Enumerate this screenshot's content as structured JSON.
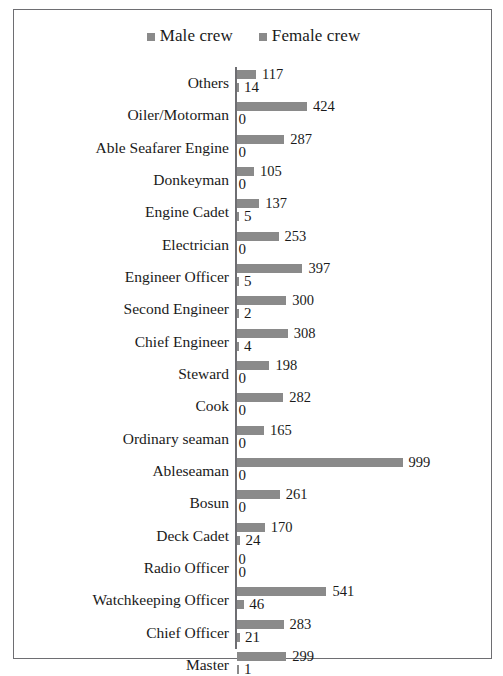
{
  "chart_data": {
    "type": "bar",
    "orientation": "horizontal",
    "grouped": true,
    "title": "",
    "subtitle": "",
    "xlabel": "",
    "ylabel": "",
    "grid": false,
    "legend_position": "top-center",
    "xlim": [
      0,
      999
    ],
    "axis_origin_value": 0,
    "categories": [
      "Others",
      "Oiler/Motorman",
      "Able Seafarer Engine",
      "Donkeyman",
      "Engine Cadet",
      "Electrician",
      "Engineer Officer",
      "Second Engineer",
      "Chief Engineer",
      "Steward",
      "Cook",
      "Ordinary seaman",
      "Ableseaman",
      "Bosun",
      "Deck Cadet",
      "Radio Officer",
      "Watchkeeping Officer",
      "Chief Officer",
      "Master"
    ],
    "series": [
      {
        "name": "Male crew",
        "color": "#8a8a8a",
        "values": [
          117,
          424,
          287,
          105,
          137,
          253,
          397,
          300,
          308,
          198,
          282,
          165,
          999,
          261,
          170,
          0,
          541,
          283,
          299
        ]
      },
      {
        "name": "Female crew",
        "color": "#8a8a8a",
        "values": [
          14,
          0,
          0,
          0,
          5,
          0,
          5,
          2,
          4,
          0,
          0,
          0,
          0,
          0,
          24,
          0,
          46,
          21,
          1
        ]
      }
    ]
  },
  "legend": {
    "items": [
      {
        "label": "Male crew",
        "swatch": "legend-swatch-male",
        "color": "#8a8a8a"
      },
      {
        "label": "Female crew",
        "swatch": "legend-swatch-female",
        "color": "#8a8a8a"
      }
    ]
  },
  "frame": {
    "border_color": "#6e6e72",
    "background": "#ffffff"
  }
}
